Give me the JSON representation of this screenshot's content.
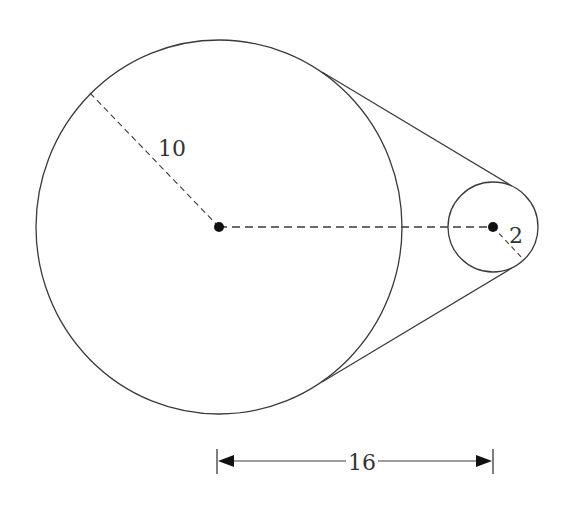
{
  "diagram": {
    "large_circle": {
      "label": "10",
      "radius_value": 10
    },
    "small_circle": {
      "label": "2",
      "radius_value": 2
    },
    "center_distance": {
      "label": "16",
      "value": 16
    },
    "colors": {
      "stroke": "#3a3a3a",
      "background": "#ffffff"
    }
  }
}
